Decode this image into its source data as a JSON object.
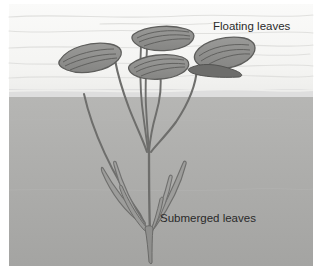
{
  "figure": {
    "labels": {
      "floating": "Floating leaves",
      "submerged": "Submerged leaves"
    },
    "regions": {
      "air_label": "air above water",
      "water_label": "water",
      "waterline_label": "water surface"
    },
    "colors": {
      "air": "#f7f7f5",
      "air_ripple": "#e2e2e0",
      "water_top": "#b4b4b2",
      "water_bottom": "#a6a6a4",
      "waterline": "#d9d9d7",
      "leaf_fill": "#8d8d8b",
      "leaf_fill_dark": "#6f6f6d",
      "leaf_vein": "#5c5c5a",
      "stem": "#6e6e6c",
      "submerged_leaf": "#9a9a98",
      "label_text": "#2a2a2a",
      "page_background": "#ffffff"
    },
    "geometry": {
      "canvas_width": 326,
      "canvas_height": 280,
      "content_left": 9,
      "content_top": 4,
      "content_right": 313,
      "content_bottom": 266,
      "waterline_y": 96
    },
    "counts": {
      "floating_leaves": 4,
      "submerged_leaf_blades": 6,
      "stems": 5
    }
  }
}
